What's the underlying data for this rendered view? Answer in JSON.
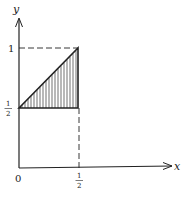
{
  "diagram": {
    "axes": {
      "x_label": "x",
      "y_label": "y",
      "origin_label": "0"
    },
    "ticks": {
      "x": [
        {
          "value": "1/2",
          "num": "1",
          "den": "2"
        }
      ],
      "y": [
        {
          "value": "1",
          "text": "1"
        },
        {
          "value": "1/2",
          "num": "1",
          "den": "2"
        }
      ]
    },
    "region": {
      "shape": "triangle",
      "vertices": [
        [
          0,
          0.5
        ],
        [
          0.5,
          1
        ],
        [
          0.5,
          0.5
        ]
      ],
      "fill": "vertical hatching"
    },
    "guides": [
      {
        "type": "dashed",
        "from": [
          0,
          1
        ],
        "to": [
          0.5,
          1
        ]
      },
      {
        "type": "dashed",
        "from": [
          0.5,
          0.5
        ],
        "to": [
          0.5,
          0
        ]
      }
    ],
    "colors": {
      "ink": "#222222",
      "background": "#ffffff"
    }
  }
}
